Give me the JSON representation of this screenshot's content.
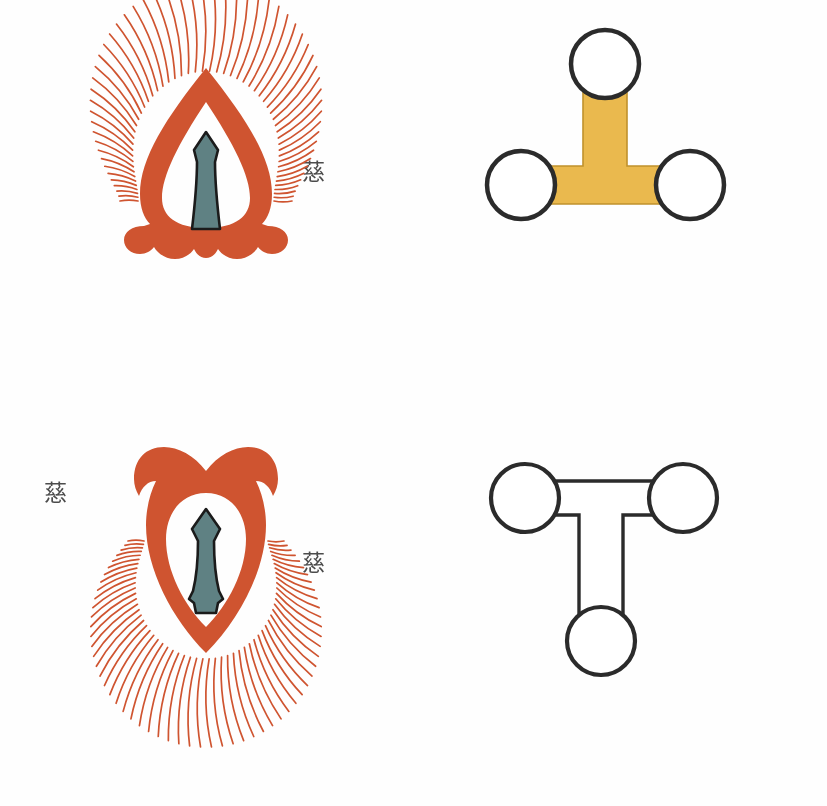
{
  "page": {
    "background_color": "#ffffff",
    "width": 827,
    "height": 806
  },
  "colors": {
    "flame_orange": "#cf5430",
    "flame_orange_dark": "#c04a26",
    "inner_teal": "#5f8183",
    "inner_outline": "#1b1b1b",
    "bar_yellow": "#eab94e",
    "bar_yellow_edge": "#c8982f",
    "outline_black": "#2b2b2b",
    "glyph_ink": "#2e2e2e"
  },
  "panels": [
    {
      "id": "panel-top-left",
      "figure": {
        "name": "flame-mandorla-upright",
        "type": "flame",
        "orientation": "upright",
        "fill": "#cf5430",
        "inner_fill": "#5f8183",
        "ray_count": 54
      },
      "left_caption": {
        "name": "caption-left",
        "glyphs": [
          "㔕",
          "𣽞"
        ]
      },
      "right_caption": {
        "name": "caption-right",
        "glyphs": [
          "慈",
          "䂖"
        ]
      }
    },
    {
      "id": "panel-top-right",
      "figure": {
        "name": "tri-node-tee-filled",
        "type": "tee-diagram",
        "orientation": "upright-stem-up",
        "bar_fill": "#eab94e",
        "node_fill": "#ffffff",
        "node_count": 3,
        "nodes": [
          "top",
          "left",
          "right"
        ]
      },
      "left_caption": {
        "name": "caption-left",
        "glyphs": [
          "㔕",
          "戛",
          "荓"
        ]
      },
      "right_caption": {
        "name": "caption-right",
        "glyphs": [
          "㒞",
          "𯩻"
        ]
      }
    },
    {
      "id": "panel-bottom-left",
      "figure": {
        "name": "flame-mandorla-inverted",
        "type": "flame",
        "orientation": "inverted",
        "fill": "#cf5430",
        "inner_fill": "#5f8183",
        "ray_count": 54
      },
      "left_caption": {
        "name": "caption-left",
        "glyphs": [
          "慈",
          "邔",
          "䳸",
          "㩬"
        ],
        "glyphs_lower": [
          "㔕",
          "瓊"
        ]
      },
      "right_caption": {
        "name": "caption-right",
        "glyphs": [
          "慈",
          "䂖"
        ]
      }
    },
    {
      "id": "panel-bottom-right",
      "figure": {
        "name": "tri-node-tee-outline",
        "type": "tee-diagram",
        "orientation": "inverted-stem-down",
        "bar_fill": "#ffffff",
        "node_fill": "#ffffff",
        "node_count": 3,
        "nodes": [
          "top-left",
          "top-right",
          "bottom"
        ]
      },
      "left_caption": {
        "name": "caption-left",
        "glyphs": [
          "㔕",
          "瓊"
        ]
      },
      "right_caption": {
        "name": "caption-right",
        "glyphs": [
          "戛",
          "㒞"
        ]
      }
    }
  ]
}
